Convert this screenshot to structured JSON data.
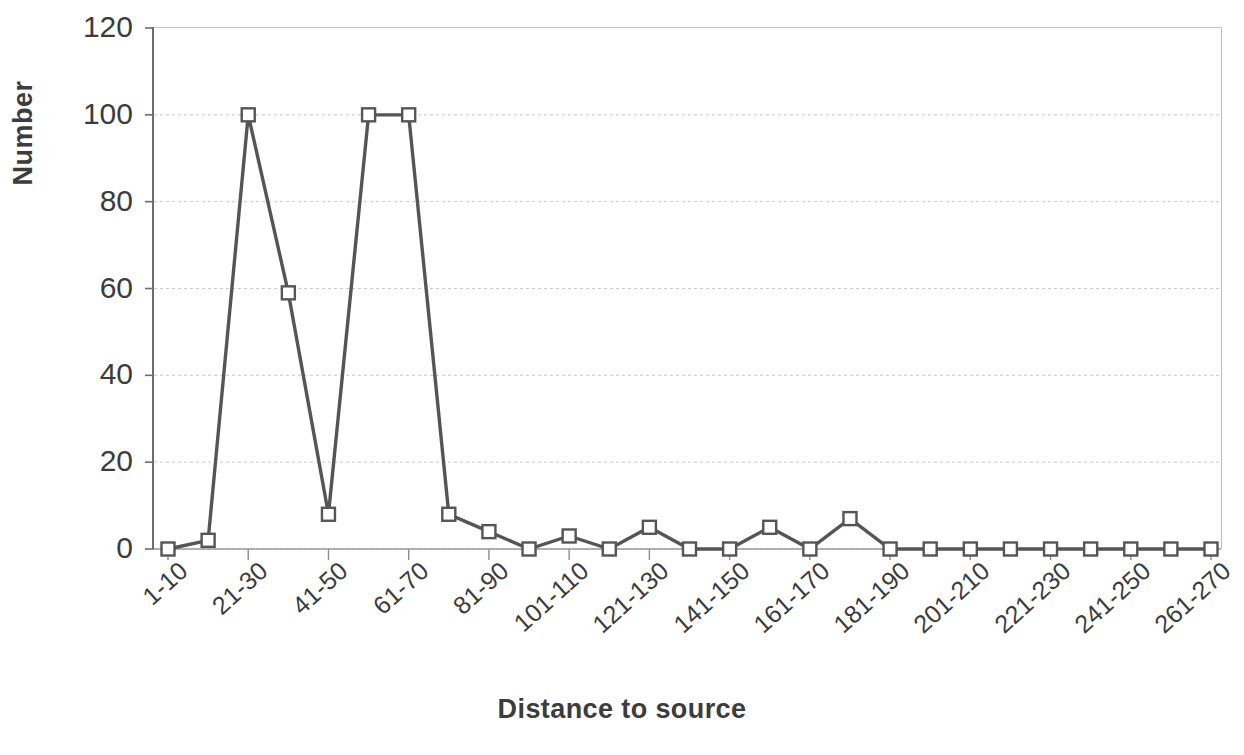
{
  "chart_data": {
    "type": "line",
    "title": "",
    "xlabel": "Distance to source",
    "ylabel": "Number",
    "ylim": [
      0,
      120
    ],
    "yticks": [
      0,
      20,
      40,
      60,
      80,
      100,
      120
    ],
    "grid": true,
    "legend": "none",
    "marker": "open-square",
    "line_color": "#555555",
    "marker_fill": "#ffffff",
    "marker_edge": "#555555",
    "categories": [
      "1-10",
      "11-20",
      "21-30",
      "31-40",
      "41-50",
      "51-60",
      "61-70",
      "71-80",
      "81-90",
      "91-100",
      "101-110",
      "111-120",
      "121-130",
      "131-140",
      "141-150",
      "151-160",
      "161-170",
      "171-180",
      "181-190",
      "191-200",
      "201-210",
      "211-220",
      "221-230",
      "231-240",
      "241-250",
      "251-260",
      "261-270"
    ],
    "tick_labels_shown": [
      "1-10",
      "21-30",
      "41-50",
      "61-70",
      "81-90",
      "101-110",
      "121-130",
      "141-150",
      "161-170",
      "181-190",
      "201-210",
      "221-230",
      "241-250",
      "261-270"
    ],
    "values": [
      0,
      2,
      100,
      59,
      8,
      100,
      100,
      8,
      4,
      0,
      3,
      0,
      5,
      0,
      0,
      5,
      0,
      7,
      0,
      0,
      0,
      0,
      0,
      0,
      0,
      0,
      0
    ],
    "xlabel_rotation_degrees": -42
  }
}
